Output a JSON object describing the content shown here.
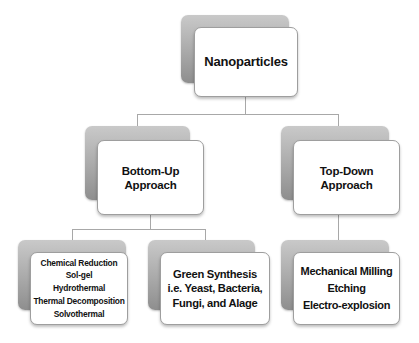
{
  "diagram": {
    "type": "hierarchy",
    "root": {
      "label": "Nanoparticles"
    },
    "approaches": [
      {
        "label_line1": "Bottom-Up",
        "label_line2": "Approach",
        "methods_groups": [
          {
            "items": [
              "Chemical Reduction",
              "Sol-gel",
              "Hydrothermal",
              "Thermal Decomposition",
              "Solvothermal"
            ]
          },
          {
            "lines": [
              "Green Synthesis",
              "i.e. Yeast, Bacteria,",
              "Fungi, and Alage"
            ]
          }
        ]
      },
      {
        "label_line1": "Top-Down",
        "label_line2": "Approach",
        "methods_groups": [
          {
            "items": [
              "Mechanical Milling",
              "Etching",
              "Electro-explosion"
            ]
          }
        ]
      }
    ]
  },
  "colors": {
    "background": "#ffffff",
    "card": "#ffffff",
    "card_shadow": "#a9a9a9",
    "connector": "#a8a8a8",
    "text": "#111111"
  }
}
